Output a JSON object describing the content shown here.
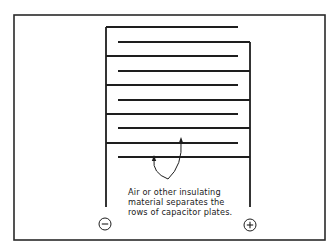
{
  "diagram": {
    "frame": {
      "x": 14,
      "y": 15,
      "w": 311,
      "h": 225,
      "color": "#2a2a2a"
    },
    "line_color": "#1e1e1e",
    "left_comb": {
      "spine_x": 106,
      "spine_top": 27,
      "spine_bottom": 207,
      "plate_end_x": 238,
      "plates_y": [
        27,
        56,
        85,
        114,
        143
      ]
    },
    "right_comb": {
      "spine_x": 250,
      "spine_top": 42,
      "spine_bottom": 207,
      "plate_start_x": 118,
      "plates_y": [
        42,
        71,
        100,
        128,
        157
      ]
    },
    "terminals": {
      "negative": {
        "symbol": "−",
        "cx": 105,
        "cy": 224,
        "r": 6,
        "label": "negative-terminal"
      },
      "positive": {
        "symbol": "+",
        "cx": 250,
        "cy": 225,
        "r": 6,
        "label": "positive-terminal"
      }
    },
    "callout": {
      "lines": [
        "Air or other insulating",
        "material separates the",
        "rows of capacitor plates."
      ],
      "arrows": [
        {
          "from": [
            168,
            179
          ],
          "to": [
            154,
            155
          ]
        },
        {
          "from": [
            168,
            179
          ],
          "to": [
            181,
            137
          ]
        }
      ]
    }
  }
}
